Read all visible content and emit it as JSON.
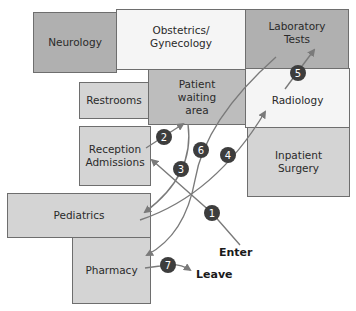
{
  "rooms": [
    {
      "id": "neurology",
      "label": "Neurology"
    },
    {
      "id": "obstetrics",
      "label": "Obstetrics/\nGynecology"
    },
    {
      "id": "laboratory",
      "label": "Laboratory\nTests"
    },
    {
      "id": "restrooms",
      "label": "Restrooms"
    },
    {
      "id": "waiting",
      "label": "Patient\nwaiting\narea"
    },
    {
      "id": "radiology",
      "label": "Radiology"
    },
    {
      "id": "reception",
      "label": "Reception\nAdmissions"
    },
    {
      "id": "surgery",
      "label": "Inpatient\nSurgery"
    },
    {
      "id": "pediatrics",
      "label": "Pediatrics"
    },
    {
      "id": "pharmacy",
      "label": "Pharmacy"
    }
  ],
  "steps": [
    "1",
    "2",
    "3",
    "4",
    "5",
    "6",
    "7"
  ],
  "endpoints": {
    "enter": "Enter",
    "leave": "Leave"
  },
  "colors": {
    "path": "#7a7a7a",
    "marker": "#3d3d3d",
    "marker_text": "#ffffff"
  }
}
